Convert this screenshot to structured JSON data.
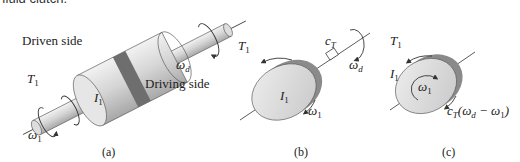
{
  "top_caption": "fluid clutch.",
  "panel_a": {
    "label": "(a)",
    "driven_side": "Driven side",
    "driving_side": "Driving side",
    "torque": {
      "sym": "T",
      "sub": "1"
    },
    "inertia": {
      "sym": "I",
      "sub": "1"
    },
    "omega1": {
      "sym": "ω",
      "sub": "1"
    },
    "omegad": {
      "sym": "ω",
      "sub": "d"
    }
  },
  "panel_b": {
    "label": "(b)",
    "torque": {
      "sym": "T",
      "sub": "1"
    },
    "inertia": {
      "sym": "I",
      "sub": "1"
    },
    "omega1": {
      "sym": "ω",
      "sub": "1"
    },
    "omegad": {
      "sym": "ω",
      "sub": "d"
    },
    "damper": {
      "sym": "c",
      "sub": "T"
    }
  },
  "panel_c": {
    "label": "(c)",
    "torque": {
      "sym": "T",
      "sub": "1"
    },
    "inertia": {
      "sym": "I",
      "sub": "1"
    },
    "omega1": {
      "sym": "ω",
      "sub": "1"
    },
    "damping_torque": {
      "c": "c",
      "c_sub": "T",
      "open": "(ω",
      "d_sub": "d",
      "minus": " − ω",
      "one_sub": "1",
      "close": ")"
    }
  },
  "colors": {
    "body": "#d9d9d9",
    "band": "#6e6e6e",
    "edge": "#555555",
    "line": "#333333"
  }
}
